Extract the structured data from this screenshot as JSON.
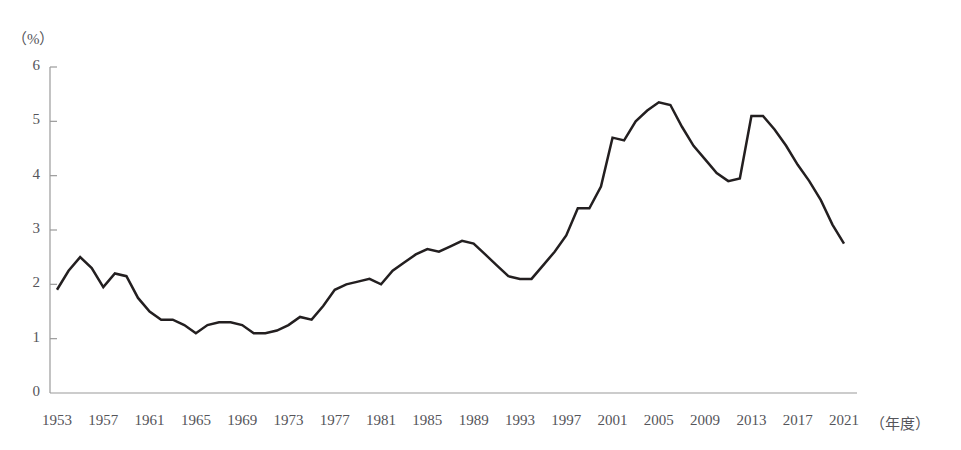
{
  "chart_data": {
    "type": "line",
    "title": "",
    "subtitle": "",
    "xlabel": "（年度）",
    "ylabel": "（%）",
    "unit_label": "（%）",
    "ylim": [
      0,
      6
    ],
    "ytick_values": [
      0,
      1,
      2,
      3,
      4,
      5,
      6
    ],
    "ytick_labels": [
      "0",
      "1",
      "2",
      "3",
      "4",
      "5",
      "6"
    ],
    "xlim": [
      1953,
      2021
    ],
    "xtick_values": [
      1953,
      1957,
      1961,
      1965,
      1969,
      1973,
      1977,
      1981,
      1985,
      1989,
      1993,
      1997,
      2001,
      2005,
      2009,
      2013,
      2017,
      2021
    ],
    "xtick_labels": [
      "1953",
      "1957",
      "1961",
      "1965",
      "1969",
      "1973",
      "1977",
      "1981",
      "1985",
      "1989",
      "1993",
      "1997",
      "2001",
      "2005",
      "2009",
      "2013",
      "2017",
      "2021"
    ],
    "grid": false,
    "legend": false,
    "legend_position": "none",
    "line_color": "#231f20",
    "axis_color": "#9a9a9a",
    "line_width": 2.5,
    "x": [
      1953,
      1954,
      1955,
      1956,
      1957,
      1958,
      1959,
      1960,
      1961,
      1962,
      1963,
      1964,
      1965,
      1966,
      1967,
      1968,
      1969,
      1970,
      1971,
      1972,
      1973,
      1974,
      1975,
      1976,
      1977,
      1978,
      1979,
      1980,
      1981,
      1982,
      1983,
      1984,
      1985,
      1986,
      1987,
      1988,
      1989,
      1990,
      1991,
      1992,
      1993,
      1994,
      1995,
      1996,
      1997,
      1998,
      1999,
      2000,
      2001,
      2002,
      2003,
      2004,
      2005,
      2006,
      2007,
      2008,
      2009,
      2010,
      2011,
      2012,
      2013,
      2014,
      2015,
      2016,
      2017,
      2018,
      2019,
      2020,
      2021
    ],
    "values": [
      1.9,
      2.25,
      2.5,
      2.3,
      1.95,
      2.2,
      2.15,
      1.75,
      1.5,
      1.35,
      1.35,
      1.25,
      1.1,
      1.25,
      1.3,
      1.3,
      1.25,
      1.1,
      1.1,
      1.15,
      1.25,
      1.4,
      1.35,
      1.6,
      1.9,
      2.0,
      2.05,
      2.1,
      2.0,
      2.25,
      2.4,
      2.55,
      2.65,
      2.6,
      2.7,
      2.8,
      2.75,
      2.55,
      2.35,
      2.15,
      2.1,
      2.1,
      2.35,
      2.6,
      2.9,
      3.4,
      3.4,
      3.8,
      4.7,
      4.65,
      5.0,
      5.2,
      5.35,
      5.3,
      4.9,
      4.55,
      4.3,
      4.05,
      3.9,
      3.95,
      5.1,
      5.1,
      4.85,
      4.55,
      4.2,
      3.9,
      3.55,
      3.1,
      2.75
    ],
    "series_name": "",
    "annotations": []
  },
  "axes": {
    "y_axis_name": "y-axis",
    "x_axis_name": "x-axis"
  }
}
